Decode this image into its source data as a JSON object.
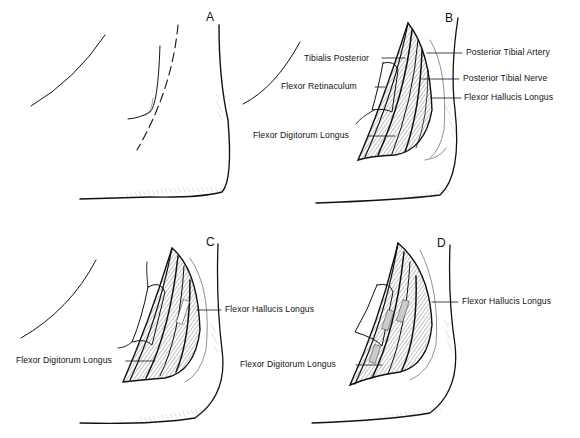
{
  "figure": {
    "panels": [
      {
        "id": "A",
        "letter": "A",
        "labels": []
      },
      {
        "id": "B",
        "letter": "B",
        "labels": [
          "Tibialis Posterior",
          "Flexor Retinaculum",
          "Flexor Digitorum Longus",
          "Posterior Tibial Artery",
          "Posterior Tibial Nerve",
          "Flexor Hallucis Longus"
        ]
      },
      {
        "id": "C",
        "letter": "C",
        "labels": [
          "Flexor Hallucis Longus",
          "Flexor Digitorum Longus"
        ]
      },
      {
        "id": "D",
        "letter": "D",
        "labels": [
          "Flexor Hallucis Longus",
          "Flexor Digitorum Longus"
        ]
      }
    ]
  }
}
